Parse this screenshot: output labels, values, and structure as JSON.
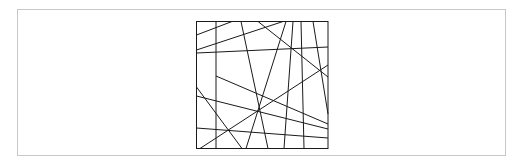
{
  "figure": {
    "frame": {
      "x": 17,
      "y": 9,
      "w": 489,
      "h": 147,
      "stroke": "#c8c8c8"
    },
    "square": {
      "x": 196.5,
      "y": 21.5,
      "w": 131.5,
      "h": 127,
      "stroke": "#1a1a1a"
    },
    "line_color": "#1a1a1a",
    "lines": [
      [
        216,
        21.5,
        216,
        148.5
      ],
      [
        196.5,
        35,
        232,
        21.5
      ],
      [
        196.5,
        50,
        283,
        21.5
      ],
      [
        196.5,
        53,
        328,
        47
      ],
      [
        241,
        21.5,
        268,
        148.5
      ],
      [
        258,
        21.5,
        328,
        77
      ],
      [
        286,
        21.5,
        246,
        148.5
      ],
      [
        293,
        21.5,
        284,
        148.5
      ],
      [
        301,
        21.5,
        304,
        148.5
      ],
      [
        313,
        21.5,
        328,
        114
      ],
      [
        216,
        76,
        328,
        124
      ],
      [
        196.5,
        87,
        242,
        148.5
      ],
      [
        196.5,
        96,
        328,
        129
      ],
      [
        196.5,
        128,
        328,
        138
      ],
      [
        200,
        148.5,
        328,
        65
      ]
    ]
  }
}
